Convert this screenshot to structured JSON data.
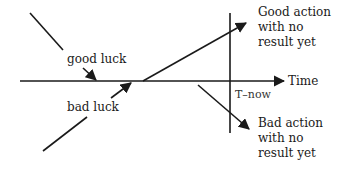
{
  "diagram": {
    "axis": {
      "label": "Time",
      "now_label": "T–now"
    },
    "luck": {
      "good": "good luck",
      "bad": "bad luck"
    },
    "outcomes": {
      "good": [
        "Good action",
        "with no",
        "result yet"
      ],
      "bad": [
        "Bad action",
        "with no",
        "result yet"
      ]
    },
    "colors": {
      "ink": "#1a1a1a",
      "background": "#ffffff"
    }
  }
}
